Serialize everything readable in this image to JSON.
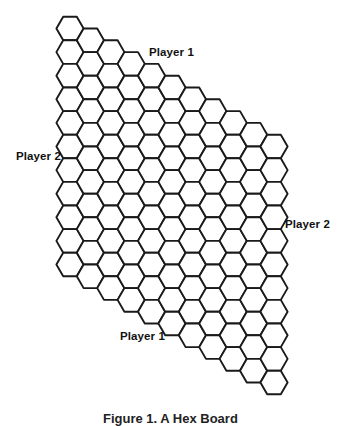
{
  "board": {
    "name": "Hex board",
    "size": 11,
    "rows": 11,
    "cols": 11,
    "hex_orientation": "flat-top",
    "geometry": {
      "x0": 70,
      "y0": 28.5,
      "col_dx": 20.4,
      "row_h": 23.6,
      "radius": 13.6
    },
    "line_color": "#1a1a1a",
    "cell_fill": "#ffffff"
  },
  "labels": {
    "top": "Player 1",
    "left": "Player 2",
    "right": "Player 2",
    "bottom": "Player 1"
  },
  "caption": "Figure 1. A Hex Board"
}
